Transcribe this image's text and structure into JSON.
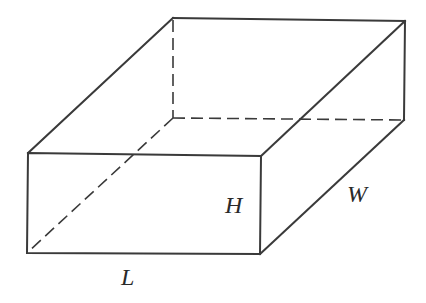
{
  "figure": {
    "type": "rectangular-box-3d",
    "stroke_color": "#3a3a3a",
    "labels": {
      "length": "L",
      "height": "H",
      "width": "W"
    },
    "vertices": {
      "front_top_left": [
        28,
        153
      ],
      "front_top_right": [
        261,
        156
      ],
      "front_bottom_left": [
        27,
        253
      ],
      "front_bottom_right": [
        260,
        254
      ],
      "back_top_left": [
        173,
        18
      ],
      "back_top_right": [
        405,
        21
      ],
      "back_bottom_left": [
        173,
        118
      ],
      "back_bottom_right": [
        404,
        120
      ]
    },
    "visible_edges": [
      "front_top_left-front_top_right",
      "front_top_right-front_bottom_right",
      "front_bottom_right-front_bottom_left",
      "front_bottom_left-front_top_left",
      "front_top_left-back_top_left",
      "back_top_left-back_top_right",
      "back_top_right-front_top_right",
      "back_top_right-back_bottom_right",
      "back_bottom_right-front_bottom_right"
    ],
    "hidden_edges": [
      "back_top_left-back_bottom_left",
      "back_bottom_left-back_bottom_right",
      "back_bottom_left-front_bottom_left"
    ]
  }
}
